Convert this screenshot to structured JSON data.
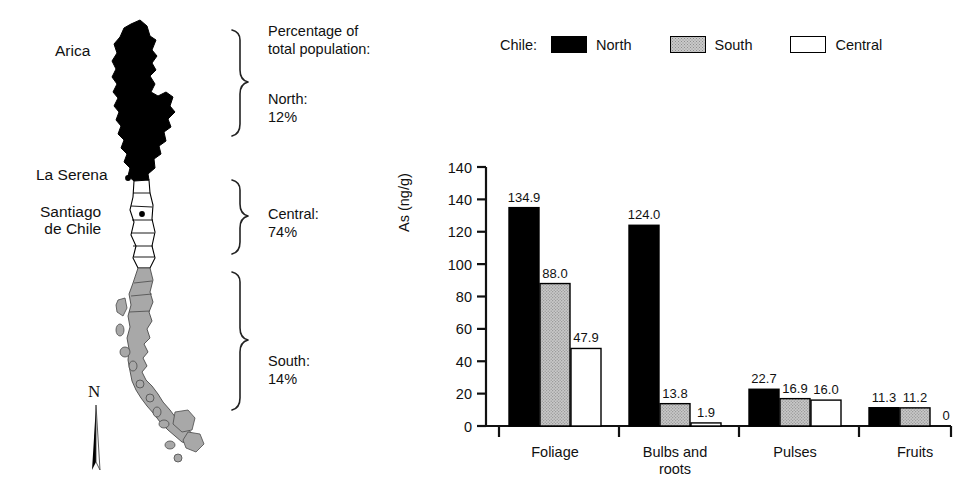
{
  "map": {
    "cities": [
      {
        "id": "arica",
        "label": "Arica"
      },
      {
        "id": "la-serena",
        "label": "La Serena"
      },
      {
        "id": "santiago",
        "label": "Santiago\nde Chile"
      }
    ],
    "caption": "Percentage of\ntotal population:",
    "regions": [
      {
        "id": "north",
        "label": "North:\n12%",
        "name": "North",
        "percent": "12%",
        "fill": "#000000"
      },
      {
        "id": "central",
        "label": "Central:\n74%",
        "name": "Central",
        "percent": "74%",
        "fill": "#ffffff"
      },
      {
        "id": "south",
        "label": "South:\n14%",
        "name": "South",
        "percent": "14%",
        "fill": "#a8a8a8"
      }
    ],
    "compass": "N"
  },
  "legend": {
    "title": "Chile:",
    "items": [
      {
        "label": "North",
        "swatch": "black"
      },
      {
        "label": "South",
        "swatch": "stippled-gray"
      },
      {
        "label": "Central",
        "swatch": "white"
      }
    ]
  },
  "chart_data": {
    "type": "bar",
    "title": "",
    "xlabel": "",
    "ylabel": "As (ng/g)",
    "categories": [
      "Foliage",
      "Bulbs and\nroots",
      "Pulses",
      "Fruits"
    ],
    "series": [
      {
        "name": "North",
        "values": [
          134.9,
          124.0,
          22.7,
          11.3
        ],
        "labels": [
          "134.9",
          "124.0",
          "22.7",
          "11.3"
        ],
        "color": "#000000"
      },
      {
        "name": "South",
        "values": [
          88.0,
          13.8,
          16.9,
          11.2
        ],
        "labels": [
          "88.0",
          "13.8",
          "16.9",
          "11.2"
        ],
        "color": "#c9c9c9"
      },
      {
        "name": "Central",
        "values": [
          47.9,
          1.9,
          16.0,
          0
        ],
        "labels": [
          "47.9",
          "1.9",
          "16.0",
          "0"
        ],
        "color": "#ffffff"
      }
    ],
    "yticks": [
      "140",
      "140",
      "120",
      "100",
      "80",
      "60",
      "40",
      "20",
      "0"
    ],
    "ytick_values": [
      160,
      140,
      120,
      100,
      80,
      60,
      40,
      20,
      0
    ],
    "ylim": [
      0,
      160
    ],
    "grid": false,
    "legend_position": "top"
  }
}
